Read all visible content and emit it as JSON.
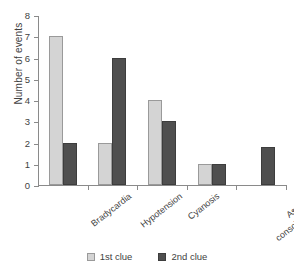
{
  "chart_data": {
    "type": "bar",
    "title": "",
    "xlabel": "",
    "ylabel": "Number of events",
    "ylim": [
      0,
      8
    ],
    "yticks": [
      0,
      1,
      2,
      3,
      4,
      5,
      6,
      7,
      8
    ],
    "grid": false,
    "legend_position": "bottom",
    "categories": [
      "Bradycardia",
      "Hypotension",
      "Cyanosis",
      "Loss of consciousness",
      "Asystole"
    ],
    "series": [
      {
        "name": "1st clue",
        "color": "#d4d4d4",
        "values": [
          7,
          2,
          4,
          1,
          0
        ]
      },
      {
        "name": "2nd clue",
        "color": "#4f4f4f",
        "values": [
          2,
          6,
          3,
          1,
          1.8
        ]
      }
    ]
  }
}
